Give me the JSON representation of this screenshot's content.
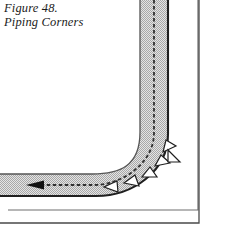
{
  "figure": {
    "caption_line1": "Figure 48.",
    "caption_line2": "Piping Corners",
    "number": "48",
    "title": "Piping Corners"
  },
  "illustration": {
    "type": "technical-sewing-diagram",
    "subject": "piping strip stitched around a right-angle fabric corner",
    "elements": [
      {
        "name": "fabric-panel",
        "description": "background fabric with right-angle corner edge",
        "stroke": "#3a3a3a"
      },
      {
        "name": "piping-strip",
        "description": "stippled bias strip running vertically, curving to horizontal at corner",
        "fill": "#d9d9d9",
        "stroke": "#2b2b2b",
        "width_px": 22
      },
      {
        "name": "stitch-line",
        "description": "dashed seam line following centre of piping strip",
        "style": "dashed",
        "stroke": "#333333"
      },
      {
        "name": "direction-arrow",
        "description": "arrowhead at end of stitch line pointing left, showing sewing direction",
        "points": "left",
        "fill": "#111111"
      },
      {
        "name": "corner-notches",
        "description": "V-shaped clips cut into outer edge of strip so it eases around the curve",
        "count": 5,
        "shape": "triangular-wedge"
      },
      {
        "name": "frame-border",
        "description": "thin rule along bottom and right of illustration area",
        "stroke": "#4a4a4a"
      }
    ],
    "colors": {
      "paper": "#ffffff",
      "strip_fill": "#d9d9d9",
      "ink": "#2b2b2b",
      "ink_light": "#6a6a6a"
    }
  }
}
